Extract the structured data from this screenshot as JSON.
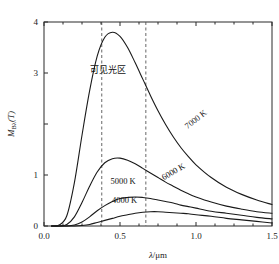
{
  "chart_data": {
    "type": "line",
    "title": "",
    "subtitle": "",
    "xlabel": "λ/μm",
    "ylabel": "M_Bλ(T)",
    "ylabel_parts": {
      "main": "M",
      "sub": "Bλ",
      "paren": "(T)"
    },
    "xlim": [
      0.0,
      1.5
    ],
    "ylim": [
      0,
      4
    ],
    "xticks": [
      0.0,
      0.5,
      1.0,
      1.5
    ],
    "xticklabels": [
      "0.0",
      "0.5",
      "1.0",
      "1.5"
    ],
    "xminorticks": [
      0.125,
      0.25,
      0.375,
      0.625,
      0.75,
      0.875,
      1.125,
      1.25,
      1.375
    ],
    "yticks": [
      0,
      1,
      2,
      3,
      4
    ],
    "yticklabels": [
      "0",
      "1",
      "",
      "3",
      "4"
    ],
    "grid": false,
    "legend_position": "inline-on-curves",
    "frame": "box",
    "annotations": [
      {
        "name": "visible-region-label",
        "text": "可见光区",
        "x": 0.42,
        "y": 3.0,
        "rotation": 0
      },
      {
        "name": "curve-label-7000k",
        "text": "7000 K",
        "x": 1.01,
        "y": 2.05,
        "rotation": -38
      },
      {
        "name": "curve-label-6000k",
        "text": "6000 K",
        "x": 0.86,
        "y": 1.02,
        "rotation": -30
      },
      {
        "name": "curve-label-5000k",
        "text": "5000 K",
        "x": 0.52,
        "y": 0.82,
        "rotation": 0
      },
      {
        "name": "curve-label-4000k",
        "text": "4000 K",
        "x": 0.53,
        "y": 0.45,
        "rotation": 0
      }
    ],
    "vertical_markers": [
      {
        "name": "visible-min",
        "x": 0.38,
        "style": "dashed",
        "label": "0.38"
      },
      {
        "name": "visible-max",
        "x": 0.67,
        "style": "dashed",
        "label": "0.67"
      }
    ],
    "series": [
      {
        "name": "7000 K",
        "temperature_k": 7000,
        "color": "#1a1a1a",
        "peak": {
          "x": 0.45,
          "y": 3.8
        },
        "x": [
          0.05,
          0.1,
          0.15,
          0.2,
          0.25,
          0.3,
          0.35,
          0.4,
          0.45,
          0.5,
          0.55,
          0.6,
          0.65,
          0.7,
          0.75,
          0.8,
          0.85,
          0.9,
          0.95,
          1.0,
          1.1,
          1.2,
          1.3,
          1.4,
          1.5
        ],
        "y": [
          0.0,
          0.02,
          0.2,
          0.85,
          1.78,
          2.65,
          3.33,
          3.7,
          3.8,
          3.72,
          3.5,
          3.2,
          2.88,
          2.56,
          2.26,
          1.99,
          1.75,
          1.54,
          1.36,
          1.2,
          0.95,
          0.76,
          0.62,
          0.51,
          0.42
        ]
      },
      {
        "name": "6000 K",
        "temperature_k": 6000,
        "color": "#1a1a1a",
        "peak": {
          "x": 0.48,
          "y": 1.33
        },
        "x": [
          0.05,
          0.1,
          0.15,
          0.2,
          0.25,
          0.3,
          0.35,
          0.4,
          0.45,
          0.5,
          0.55,
          0.6,
          0.65,
          0.7,
          0.75,
          0.8,
          0.85,
          0.9,
          0.95,
          1.0,
          1.1,
          1.2,
          1.3,
          1.4,
          1.5
        ],
        "y": [
          0.0,
          0.0,
          0.03,
          0.18,
          0.46,
          0.78,
          1.06,
          1.24,
          1.32,
          1.33,
          1.29,
          1.22,
          1.13,
          1.04,
          0.95,
          0.86,
          0.78,
          0.7,
          0.63,
          0.57,
          0.47,
          0.39,
          0.33,
          0.28,
          0.25
        ]
      },
      {
        "name": "5000 K",
        "temperature_k": 5000,
        "color": "#1a1a1a",
        "peak": {
          "x": 0.58,
          "y": 0.57
        },
        "x": [
          0.05,
          0.1,
          0.15,
          0.2,
          0.25,
          0.3,
          0.35,
          0.4,
          0.45,
          0.5,
          0.55,
          0.6,
          0.65,
          0.7,
          0.75,
          0.8,
          0.85,
          0.9,
          0.95,
          1.0,
          1.1,
          1.2,
          1.3,
          1.4,
          1.5
        ],
        "y": [
          0.0,
          0.0,
          0.0,
          0.02,
          0.08,
          0.18,
          0.3,
          0.4,
          0.48,
          0.54,
          0.56,
          0.57,
          0.56,
          0.54,
          0.51,
          0.48,
          0.45,
          0.41,
          0.38,
          0.35,
          0.29,
          0.25,
          0.21,
          0.17,
          0.14
        ]
      },
      {
        "name": "4000 K",
        "temperature_k": 4000,
        "color": "#1a1a1a",
        "peak": {
          "x": 0.72,
          "y": 0.28
        },
        "x": [
          0.05,
          0.1,
          0.15,
          0.2,
          0.25,
          0.3,
          0.35,
          0.4,
          0.45,
          0.5,
          0.55,
          0.6,
          0.65,
          0.7,
          0.75,
          0.8,
          0.85,
          0.9,
          0.95,
          1.0,
          1.1,
          1.2,
          1.3,
          1.4,
          1.5
        ],
        "y": [
          0.0,
          0.0,
          0.0,
          0.0,
          0.01,
          0.03,
          0.07,
          0.11,
          0.15,
          0.19,
          0.22,
          0.25,
          0.27,
          0.28,
          0.28,
          0.27,
          0.26,
          0.25,
          0.24,
          0.22,
          0.19,
          0.15,
          0.12,
          0.09,
          0.06
        ]
      }
    ]
  }
}
